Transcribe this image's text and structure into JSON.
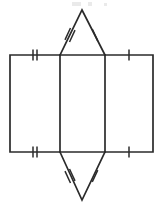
{
  "figure": {
    "kind": "geometry-net-diagram",
    "width": 163,
    "height": 207,
    "background_color": "#ffffff",
    "line_color": "#2b2b2b",
    "line_width": 1.7,
    "tick_color": "#2b2b2b",
    "tick_width": 1.5,
    "label_text": "",
    "annotations": []
  },
  "geometry": {
    "rectangle": {
      "name": "outer-rectangle",
      "left": 10,
      "right": 153,
      "top": 55,
      "bottom": 152
    },
    "fold_lines": {
      "name": "interior-vertical-fold-lines",
      "x_positions": [
        60,
        105
      ]
    },
    "panels": [
      {
        "name": "left-panel",
        "x1": 10,
        "x2": 60,
        "y1": 55,
        "y2": 152
      },
      {
        "name": "middle-panel",
        "x1": 60,
        "x2": 105,
        "y1": 55,
        "y2": 152
      },
      {
        "name": "right-panel",
        "x1": 105,
        "x2": 153,
        "y1": 55,
        "y2": 152
      }
    ],
    "top_triangle": {
      "name": "top-triangle",
      "apex_x": 82,
      "apex_y": 10,
      "base_left_x": 60,
      "base_right_x": 105,
      "base_y": 55
    },
    "bottom_triangle": {
      "name": "bottom-triangle",
      "apex_x": 82,
      "apex_y": 200,
      "base_left_x": 60,
      "base_right_x": 105,
      "base_y": 152
    }
  },
  "tick_marks": [
    {
      "name": "tick-top-left-edge",
      "on": "rectangle-top-edge-left-panel",
      "count": 2,
      "center_x": 35,
      "center_y": 55,
      "orientation": "vertical",
      "length": 11,
      "spacing": 4
    },
    {
      "name": "tick-top-right-edge",
      "on": "rectangle-top-edge-right-panel",
      "count": 1,
      "center_x": 129,
      "center_y": 55,
      "orientation": "vertical",
      "length": 11,
      "spacing": 4
    },
    {
      "name": "tick-bottom-left-edge",
      "on": "rectangle-bottom-edge-left-panel",
      "count": 2,
      "center_x": 35,
      "center_y": 152,
      "orientation": "vertical",
      "length": 11,
      "spacing": 4
    },
    {
      "name": "tick-bottom-right-edge",
      "on": "rectangle-bottom-edge-right-panel",
      "count": 1,
      "center_x": 129,
      "center_y": 152,
      "orientation": "vertical",
      "length": 11,
      "spacing": 4
    },
    {
      "name": "tick-top-triangle-left-slant",
      "on": "top-triangle-left-side",
      "count": 2,
      "center_x": 70,
      "center_y": 35,
      "angle_deg": 25,
      "length": 13,
      "spacing": 5
    },
    {
      "name": "tick-top-triangle-right-slant",
      "on": "top-triangle-right-side",
      "count": 1,
      "center_x": 95,
      "center_y": 35,
      "angle_deg": -25,
      "length": 13,
      "spacing": 5
    },
    {
      "name": "tick-bottom-triangle-left-slant",
      "on": "bottom-triangle-left-side",
      "count": 2,
      "center_x": 70,
      "center_y": 176,
      "angle_deg": -25,
      "length": 13,
      "spacing": 5
    },
    {
      "name": "tick-bottom-triangle-right-slant",
      "on": "bottom-triangle-right-side",
      "count": 1,
      "center_x": 95,
      "center_y": 176,
      "angle_deg": 25,
      "length": 13,
      "spacing": 5
    }
  ],
  "artifacts": [
    {
      "name": "cropped-text-smudge-1",
      "x": 72,
      "y": 2,
      "width": 9,
      "height": 4
    },
    {
      "name": "cropped-text-smudge-2",
      "x": 88,
      "y": 2,
      "width": 4,
      "height": 4
    },
    {
      "name": "cropped-text-smudge-3",
      "x": 104,
      "y": 3,
      "width": 3,
      "height": 3
    }
  ]
}
